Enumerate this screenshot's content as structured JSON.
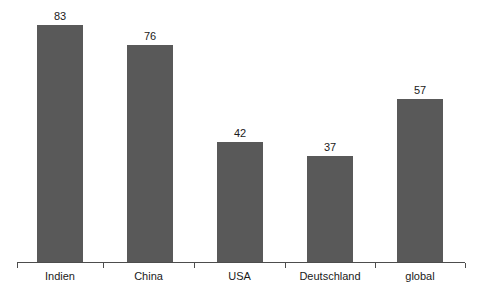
{
  "chart_data": {
    "type": "bar",
    "title": "",
    "subtitle": "",
    "xlabel": "",
    "ylabel": "",
    "categories": [
      "Indien",
      "China",
      "USA",
      "Deutschland",
      "global"
    ],
    "values": [
      83,
      76,
      42,
      37,
      57
    ],
    "value_labels": [
      "83",
      "76",
      "42",
      "37",
      "57"
    ],
    "ylim": [
      0,
      92
    ],
    "grid": false,
    "legend": false,
    "legend_position": "none",
    "axis_visible": {
      "x": true,
      "y": false
    },
    "bar_color": "#595959",
    "axis_color": "#4d4d4d",
    "text_color": "#1a1a1a",
    "background_color": "#ffffff",
    "tick_count": 6,
    "bars": [
      {
        "category": "Indien",
        "value": 83,
        "label": "83"
      },
      {
        "category": "China",
        "value": 76,
        "label": "76"
      },
      {
        "category": "USA",
        "value": 42,
        "label": "42"
      },
      {
        "category": "Deutschland",
        "value": 37,
        "label": "37"
      },
      {
        "category": "global",
        "value": 57,
        "label": "57"
      }
    ]
  },
  "layout": {
    "baseline_y": 262,
    "px_per_unit": 2.855,
    "bar_width": 46,
    "bar_left_positions": [
      37,
      127,
      217,
      307,
      397
    ],
    "tick_positions": [
      17,
      103,
      194,
      285,
      375,
      465
    ],
    "axis_left": 17,
    "axis_right": 465,
    "tick_length": 5,
    "label_y": 270,
    "value_label_gap": 15
  }
}
